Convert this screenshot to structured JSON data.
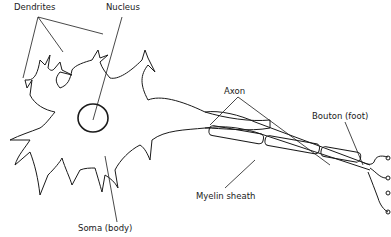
{
  "diagram": {
    "labels": {
      "dendrites": "Dendrites",
      "nucleus": "Nucleus",
      "axon": "Axon",
      "bouton": "Bouton (foot)",
      "myelin": "Myelin sheath",
      "soma": "Soma (body)"
    },
    "colors": {
      "line": "#1a1a1a",
      "background": "#ffffff"
    }
  }
}
